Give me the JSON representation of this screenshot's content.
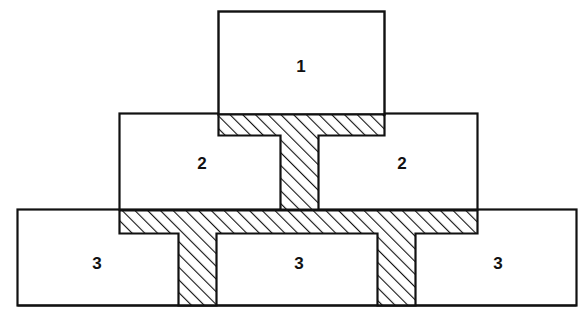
{
  "diagram": {
    "type": "hierarchical-block-diagram",
    "title": "",
    "background_color": "#ffffff",
    "stroke_color": "#111111",
    "hatch_color": "#111111",
    "fill_color": "#ffffff",
    "hatch_direction": "forward-slash-45deg",
    "levels": [
      {
        "level": 1,
        "label": "1",
        "count": 1,
        "boxes": [
          {
            "name": "box-level1",
            "label": "1",
            "x": 218,
            "y": 11,
            "w": 167,
            "h": 104,
            "label_x": 301,
            "label_y": 66
          }
        ]
      },
      {
        "level": 2,
        "label": "2",
        "count": 2,
        "boxes": [
          {
            "name": "box-level2-left",
            "label": "2",
            "x": 119,
            "y": 113,
            "w": 359,
            "h": 97,
            "label_x": 202,
            "label_y": 163
          },
          {
            "name": "box-level2-right",
            "label": "2",
            "label_x": 402,
            "label_y": 163
          }
        ]
      },
      {
        "level": 3,
        "label": "3",
        "count": 3,
        "boxes": [
          {
            "name": "box-level3-left",
            "label": "3",
            "x": 17,
            "y": 209,
            "w": 560,
            "h": 97,
            "label_x": 97,
            "label_y": 263
          },
          {
            "name": "box-level3-middle",
            "label": "3",
            "label_x": 299,
            "label_y": 263
          },
          {
            "name": "box-level3-right",
            "label": "3",
            "label_x": 498,
            "label_y": 263
          }
        ]
      }
    ],
    "connectors": [
      {
        "name": "connector-upper-tee",
        "shape": "tee",
        "bar": {
          "x": 218,
          "y": 114,
          "w": 167,
          "h": 22
        },
        "stem": {
          "x": 281,
          "y": 136,
          "w": 37,
          "h": 74
        }
      },
      {
        "name": "connector-lower-band",
        "shape": "band-with-two-stems",
        "bar": {
          "x": 119,
          "y": 210,
          "w": 359,
          "h": 24
        },
        "stems": [
          {
            "x": 179,
            "y": 234,
            "w": 37,
            "h": 72
          },
          {
            "x": 378,
            "y": 234,
            "w": 37,
            "h": 72
          }
        ]
      }
    ],
    "labels": [
      {
        "text": "1",
        "x": 301,
        "y": 66
      },
      {
        "text": "2",
        "x": 202,
        "y": 163
      },
      {
        "text": "2",
        "x": 402,
        "y": 163
      },
      {
        "text": "3",
        "x": 97,
        "y": 263
      },
      {
        "text": "3",
        "x": 299,
        "y": 263
      },
      {
        "text": "3",
        "x": 498,
        "y": 263
      }
    ]
  }
}
